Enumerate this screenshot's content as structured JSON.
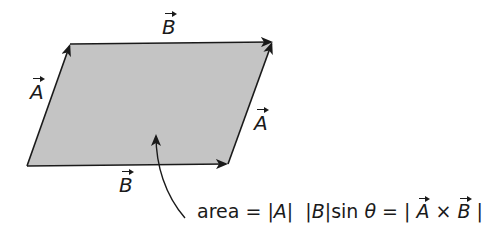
{
  "diagram": {
    "colors": {
      "fill": "#c4c4c4",
      "stroke": "#1a1a1a",
      "background": "#ffffff"
    },
    "parallelogram": {
      "corners": {
        "bottom_left": [
          27,
          166
        ],
        "top_left": [
          70,
          44
        ],
        "top_right": [
          272,
          42
        ],
        "bottom_right": [
          228,
          164
        ]
      }
    },
    "labels": {
      "top_B": "B",
      "left_A": "A",
      "right_A": "A",
      "bottom_B": "B"
    },
    "formula": {
      "prefix": "area = ",
      "absA": "|A|",
      "space": "  ",
      "absB": "|B|",
      "sin": "sin ",
      "theta": "θ",
      "eq": " = | ",
      "vecA": "A",
      "times": " × ",
      "vecB": "B",
      "close": " |"
    },
    "pointer": {
      "tip": [
        156,
        133
      ],
      "tail": [
        185,
        218
      ]
    }
  }
}
